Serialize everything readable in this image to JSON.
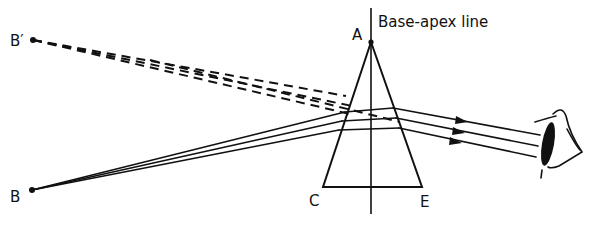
{
  "diagram": {
    "title": "Base-apex line",
    "labels": {
      "apex": "A",
      "base_left": "C",
      "base_right": "E",
      "object": "B",
      "image": "B′"
    },
    "elements": {
      "prism": "triangular prism ACE with apex A up and base CE down",
      "base_apex_line": "vertical line through apex A and base CE",
      "real_rays": "three solid rays from object B refracted through the prism toward the eye",
      "virtual_rays": "dashed rays traced back from emergent rays to virtual image B′",
      "eye": "observer eye on the right receiving parallel rays"
    }
  }
}
